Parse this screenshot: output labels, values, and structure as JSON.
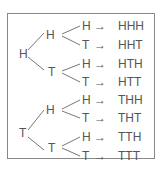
{
  "tree": {
    "root_h": "H",
    "root_t": "T",
    "level2": [
      "H",
      "T",
      "H",
      "T"
    ],
    "level3": [
      "H",
      "T",
      "H",
      "T",
      "H",
      "T",
      "H",
      "T"
    ],
    "arrow": "→",
    "outcomes": [
      "HHH",
      "HHT",
      "HTH",
      "HTT",
      "THH",
      "THT",
      "TTH",
      "TTT"
    ]
  }
}
